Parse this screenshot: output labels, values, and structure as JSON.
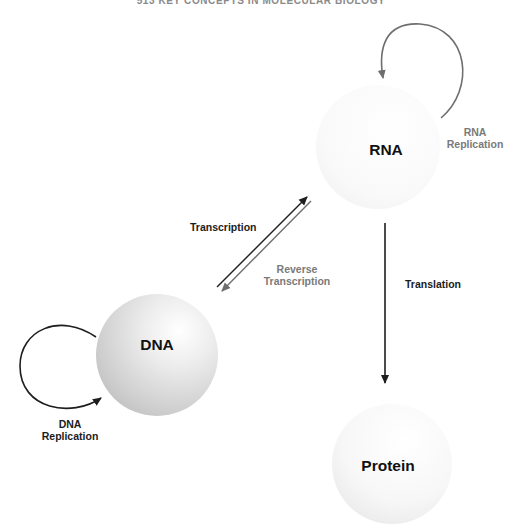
{
  "header": {
    "text": "513  KEY CONCEPTS IN MOLECULAR BIOLOGY"
  },
  "nodes": [
    {
      "id": "dna",
      "label": "DNA",
      "cx": 157,
      "cy": 355,
      "r": 61
    },
    {
      "id": "rna",
      "label": "RNA",
      "cx": 378,
      "cy": 147,
      "r": 62
    },
    {
      "id": "protein",
      "label": "Protein",
      "cx": 392,
      "cy": 464,
      "r": 60
    }
  ],
  "processes": {
    "dna_replication": {
      "line1": "DNA",
      "line2": "Replication"
    },
    "rna_replication": {
      "line1": "RNA",
      "line2": "Replication"
    },
    "transcription": {
      "label": "Transcription"
    },
    "reverse_transcription": {
      "line1": "Reverse",
      "line2": "Transcription"
    },
    "translation": {
      "label": "Translation"
    }
  },
  "colors": {
    "arrow_dark": "#1e1e1e",
    "arrow_grey": "#6e6e6e",
    "dna_sphere": "#cfcfcf",
    "rna_sphere": "#f4f4f4",
    "protein_sphere": "#eeeeee"
  }
}
